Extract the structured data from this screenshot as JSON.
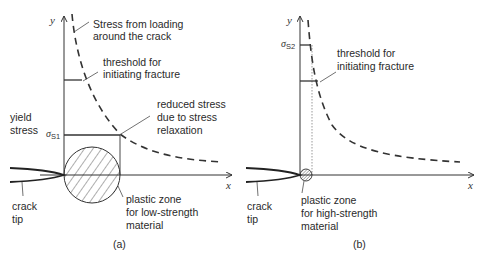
{
  "figure": {
    "panels": [
      {
        "id": "a",
        "caption": "(a)",
        "axis_x_label": "x",
        "axis_y_label": "y",
        "sigma_symbol": "σ",
        "sigma_subscript": "S1",
        "labels": {
          "stress_loading_1": "Stress from loading",
          "stress_loading_2": "around the crack",
          "threshold_1": "threshold for",
          "threshold_2": "initiating fracture",
          "reduced_1": "reduced stress",
          "reduced_2": "due to stress",
          "reduced_3": "relaxation",
          "yield_1": "yield",
          "yield_2": "stress",
          "crack_1": "crack",
          "crack_2": "tip",
          "plastic_1": "plastic zone",
          "plastic_2": "for low-strength",
          "plastic_3": "material"
        }
      },
      {
        "id": "b",
        "caption": "(b)",
        "axis_x_label": "x",
        "axis_y_label": "y",
        "sigma_symbol": "σ",
        "sigma_subscript": "S2",
        "labels": {
          "threshold_1": "threshold for",
          "threshold_2": "initiating fracture",
          "crack_1": "crack",
          "crack_2": "tip",
          "plastic_1": "plastic zone",
          "plastic_2": "for high-strength",
          "plastic_3": "material"
        }
      }
    ],
    "colors": {
      "line": "#333333",
      "text": "#2a2a2a"
    }
  }
}
